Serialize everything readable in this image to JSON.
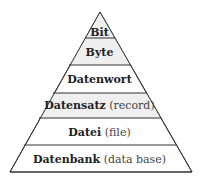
{
  "diagram": {
    "type": "pyramid",
    "levels": [
      {
        "label": "Bit",
        "note": ""
      },
      {
        "label": "Byte",
        "note": ""
      },
      {
        "label": "Datenwort",
        "note": ""
      },
      {
        "label": "Datensatz",
        "note": "(record)"
      },
      {
        "label": "Datei",
        "note": "(file)"
      },
      {
        "label": "Datenbank",
        "note": "(data base)"
      }
    ],
    "colors": {
      "stroke": "#333333",
      "shade": "#efefef",
      "fill": "#ffffff"
    }
  }
}
